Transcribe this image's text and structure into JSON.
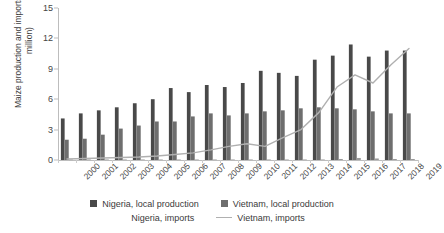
{
  "chart_data": {
    "type": "bar",
    "title": "",
    "subtitle": "",
    "xlabel": "",
    "ylabel": "Maize production and imports (tons, million)",
    "categories": [
      "2000",
      "2001",
      "2002",
      "2003",
      "2004",
      "2005",
      "2006",
      "2007",
      "2008",
      "2009",
      "2010",
      "2011",
      "2012",
      "2013",
      "2014",
      "2015",
      "2016",
      "2017",
      "2018",
      "2019"
    ],
    "ylim": [
      0,
      15
    ],
    "yticks": [
      0,
      3,
      6,
      9,
      12,
      15
    ],
    "grid": false,
    "legend_position": "bottom",
    "series": [
      {
        "name": "Nigeria, local production",
        "kind": "bar",
        "color": "#494949",
        "values": [
          4.1,
          4.6,
          4.9,
          5.2,
          5.6,
          6.0,
          7.1,
          6.7,
          7.4,
          7.2,
          7.6,
          8.8,
          8.6,
          8.3,
          9.9,
          10.3,
          11.4,
          10.2,
          10.8,
          10.8
        ]
      },
      {
        "name": "Vietnam, local production",
        "kind": "bar",
        "color": "#6e6e6e",
        "values": [
          2.0,
          2.1,
          2.5,
          3.1,
          3.4,
          3.8,
          3.8,
          4.3,
          4.6,
          4.4,
          4.6,
          4.8,
          4.9,
          5.1,
          5.2,
          5.1,
          5.0,
          4.8,
          4.6,
          4.6
        ]
      },
      {
        "name": "Nigeria, imports",
        "kind": "bar",
        "color": "#9a9a9a",
        "values": [
          0.05,
          0.05,
          0.05,
          0.05,
          0.05,
          0.05,
          0.05,
          0.05,
          0.05,
          0.05,
          0.05,
          0.05,
          0.05,
          0.05,
          0.05,
          0.1,
          0.2,
          0.15,
          0.1,
          0.1
        ]
      },
      {
        "name": "Vietnam, imports",
        "kind": "line",
        "color": "#b0b0b0",
        "values": [
          0.1,
          0.15,
          0.2,
          0.25,
          0.3,
          0.4,
          0.55,
          0.7,
          1.0,
          1.35,
          1.6,
          1.35,
          2.2,
          3.0,
          4.7,
          7.2,
          8.4,
          7.6,
          9.4,
          11.0
        ]
      }
    ]
  },
  "legend": {
    "items": [
      {
        "label": "Nigeria, local production",
        "marker": "square",
        "color": "#494949"
      },
      {
        "label": "Vietnam, local production",
        "marker": "square",
        "color": "#6e6e6e"
      },
      {
        "label": "Nigeria, imports",
        "marker": "square",
        "color": "#9a9a9a"
      },
      {
        "label": "Vietnam, imports",
        "marker": "line",
        "color": "#b0b0b0"
      }
    ]
  },
  "axes": {
    "y_title": "Maize production and imports (tons, million)",
    "y_tick_labels": [
      "0",
      "3",
      "6",
      "9",
      "12",
      "15"
    ],
    "x_tick_labels": [
      "2000",
      "2001",
      "2002",
      "2003",
      "2004",
      "2005",
      "2006",
      "2007",
      "2008",
      "2009",
      "2010",
      "2011",
      "2012",
      "2013",
      "2014",
      "2015",
      "2016",
      "2017",
      "2018",
      "2019"
    ]
  },
  "colors": {
    "axis": "#bdbdbd",
    "text": "#3a3a3a",
    "background": "#ffffff"
  }
}
